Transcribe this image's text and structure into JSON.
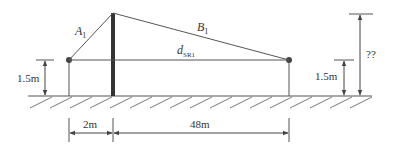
{
  "labels": {
    "a1_main": "A",
    "a1_sub": "1",
    "b1_main": "B",
    "b1_sub": "1",
    "dsr1_main": "d",
    "dsr1_sub": "SR1",
    "left_height": "1.5m",
    "right_height": "1.5m",
    "unknown_height": "??",
    "dist_left": "2m",
    "dist_right": "48m"
  },
  "colors": {
    "line": "#444444",
    "pole": "#333333",
    "background": "#ffffff"
  }
}
